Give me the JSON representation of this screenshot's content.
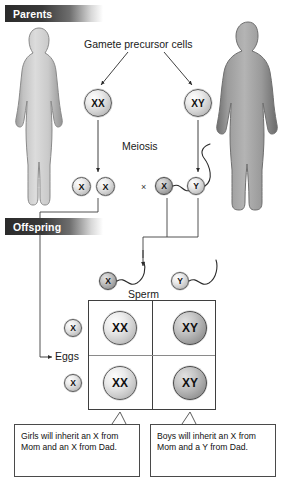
{
  "diagram": {
    "sections": {
      "parents": "Parents",
      "offspring": "Offspring"
    },
    "labels": {
      "gamete_precursor": "Gamete precursor cells",
      "meiosis": "Meiosis",
      "cross_symbol": "×",
      "sperm": "Sperm",
      "eggs": "Eggs"
    },
    "figures": {
      "mother": "female-parent-silhouette",
      "father": "male-parent-silhouette"
    },
    "precursor_cells": [
      {
        "genotype": "XX",
        "parent": "mother"
      },
      {
        "genotype": "XY",
        "parent": "father"
      }
    ],
    "meiosis_products": {
      "eggs": [
        "X",
        "X"
      ],
      "sperm": [
        "X",
        "Y"
      ]
    },
    "sperm_cells": [
      {
        "genotype": "X"
      },
      {
        "genotype": "Y"
      }
    ],
    "egg_cells": [
      {
        "genotype": "X"
      },
      {
        "genotype": "X"
      }
    ],
    "punnett_square": {
      "rows": [
        {
          "egg": "X",
          "cells": [
            "XX",
            "XY"
          ]
        },
        {
          "egg": "X",
          "cells": [
            "XX",
            "XY"
          ]
        }
      ],
      "columns": [
        "X",
        "Y"
      ]
    },
    "captions": [
      {
        "id": "girls",
        "text": "Girls will inherit an X from Mom and an X from Dad."
      },
      {
        "id": "boys",
        "text": "Boys will inherit an X from Mom and a Y from Dad."
      }
    ],
    "colors": {
      "banner_dark": "#2b2b2b",
      "line": "#3f3f3f",
      "cell_border": "#5a5a5a",
      "figure_light": "#c9c9c9",
      "figure_dark": "#8f8f8f",
      "background": "#ffffff"
    }
  }
}
